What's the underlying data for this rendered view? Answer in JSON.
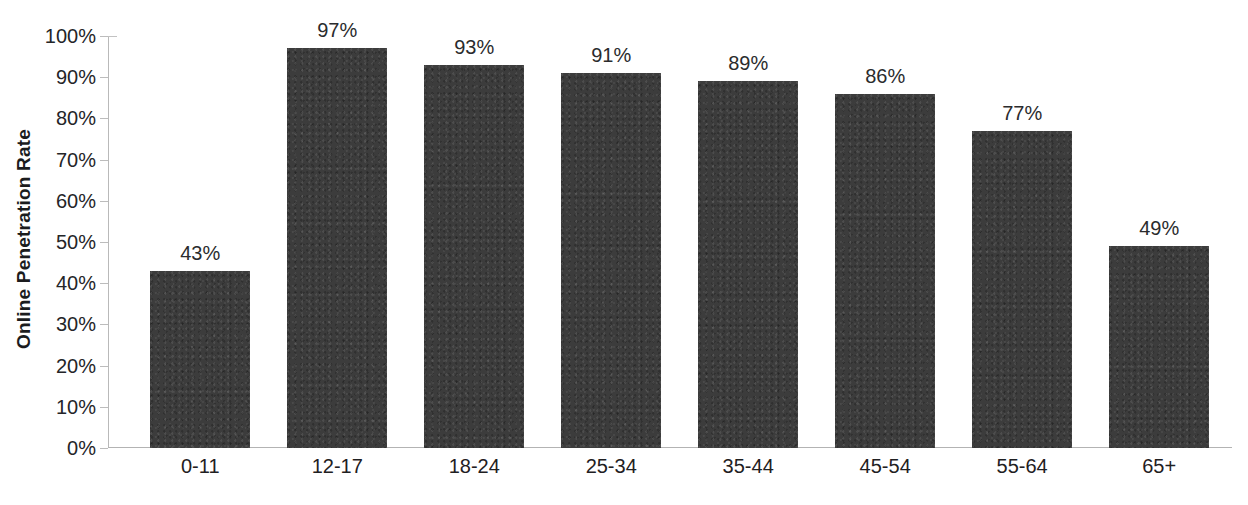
{
  "chart_data": {
    "type": "bar",
    "title": "",
    "title_note": "chart title is cropped off the top edge of the screenshot; only bottom fragments of bold glyphs are visible",
    "xlabel": "",
    "ylabel": "Online Penetration Rate",
    "categories": [
      "0-11",
      "12-17",
      "18-24",
      "25-34",
      "35-44",
      "45-54",
      "55-64",
      "65+"
    ],
    "values": [
      43,
      97,
      93,
      91,
      89,
      86,
      77,
      49
    ],
    "value_labels": [
      "43%",
      "97%",
      "93%",
      "91%",
      "89%",
      "86%",
      "77%",
      "49%"
    ],
    "ylim": [
      0,
      100
    ],
    "ytick_labels": [
      "100%",
      "90%",
      "80%",
      "70%",
      "60%",
      "50%",
      "40%",
      "30%",
      "20%",
      "10%",
      "0%"
    ],
    "ytick_values": [
      100,
      90,
      80,
      70,
      60,
      50,
      40,
      30,
      20,
      10,
      0
    ],
    "grid": false,
    "legend": false,
    "legend_position": "none",
    "bar_color": "#3c3c3c",
    "text_color": "#222325",
    "axis_color": "#b9b9b9",
    "background_color": "#ffffff",
    "series": [
      {
        "name": "Online Penetration Rate",
        "values": [
          43,
          97,
          93,
          91,
          89,
          86,
          77,
          49
        ]
      }
    ]
  }
}
